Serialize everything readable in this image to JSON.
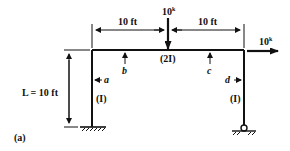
{
  "figure": {
    "caption": "(a)",
    "colors": {
      "ink": "#111111",
      "background": "#ffffff"
    }
  },
  "dimensions": {
    "left_span": "10 ft",
    "right_span": "10 ft",
    "height": "L = 10 ft"
  },
  "loads": {
    "vertical_load": "10",
    "vertical_load_unit": "k",
    "horizontal_load": "10",
    "horizontal_load_unit": "k"
  },
  "members": {
    "beam_stiffness": "(2I)",
    "left_column_stiffness": "(I)",
    "right_column_stiffness": "(I)"
  },
  "points": {
    "a": "a",
    "b": "b",
    "c": "c",
    "d": "d"
  },
  "supports": {
    "left": "fixed",
    "right": "pinned"
  }
}
